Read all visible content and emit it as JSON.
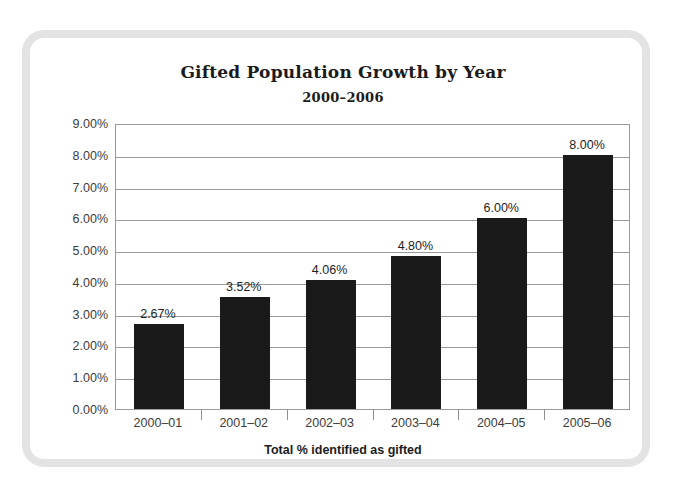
{
  "chart_data": {
    "type": "bar",
    "title": "Gifted Population Growth by Year",
    "subtitle": "2000–2006",
    "xlabel": "Total % identified as gifted",
    "ylabel": "",
    "categories": [
      "2000–01",
      "2001–02",
      "2002–03",
      "2003–04",
      "2004–05",
      "2005–06"
    ],
    "values": [
      2.67,
      3.52,
      4.06,
      4.8,
      6.0,
      8.0
    ],
    "value_labels": [
      "2.67%",
      "3.52%",
      "4.06%",
      "4.80%",
      "6.00%",
      "8.00%"
    ],
    "ylim": [
      0,
      9
    ],
    "ytick_values": [
      0,
      1,
      2,
      3,
      4,
      5,
      6,
      7,
      8,
      9
    ],
    "ytick_labels": [
      "0.00%",
      "1.00%",
      "2.00%",
      "3.00%",
      "4.00%",
      "5.00%",
      "6.00%",
      "7.00%",
      "8.00%",
      "9.00%"
    ],
    "grid": true,
    "legend": false,
    "bar_color": "#1a1a1a",
    "gridline_color": "#9a9a9a",
    "frame_color": "#e3e3e3"
  }
}
